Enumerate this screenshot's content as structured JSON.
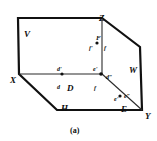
{
  "figure": {
    "caption": "(a)",
    "stroke_color": "#111111",
    "thin_color": "#2b2b2b",
    "background": "#ffffff",
    "vertices": [
      {
        "name": "V",
        "label": "V",
        "x": 24,
        "y": 30
      },
      {
        "name": "Z",
        "label": "Z",
        "x": 99,
        "y": 14
      },
      {
        "name": "W",
        "label": "W",
        "x": 129,
        "y": 66
      },
      {
        "name": "Y",
        "label": "Y",
        "x": 145,
        "y": 112
      },
      {
        "name": "H",
        "label": "H",
        "x": 61,
        "y": 104
      },
      {
        "name": "X",
        "label": "X",
        "x": 10,
        "y": 76
      },
      {
        "name": "D",
        "label": "D",
        "x": 67,
        "y": 84
      },
      {
        "name": "E",
        "label": "E",
        "x": 121,
        "y": 105
      },
      {
        "name": "F",
        "label": "F",
        "x": 96,
        "y": 35
      }
    ],
    "point_labels": [
      {
        "name": "f-prime-top",
        "label": "f'",
        "x": 89,
        "y": 45
      },
      {
        "name": "f-top",
        "label": "f",
        "x": 104,
        "y": 45
      },
      {
        "name": "d-prime",
        "label": "d'",
        "x": 57,
        "y": 66
      },
      {
        "name": "d",
        "label": "d",
        "x": 57,
        "y": 84
      },
      {
        "name": "e-prime-mid",
        "label": "e'",
        "x": 93,
        "y": 66
      },
      {
        "name": "d-double-prime",
        "label": "d″",
        "x": 106,
        "y": 74
      },
      {
        "name": "f-mid",
        "label": "f",
        "x": 94,
        "y": 85
      },
      {
        "name": "e-prime-low",
        "label": "e'",
        "x": 114,
        "y": 96
      },
      {
        "name": "e-double-prime",
        "label": "e″",
        "x": 124,
        "y": 93
      }
    ],
    "dots": [
      {
        "name": "dot-f",
        "x": 97,
        "y": 43
      },
      {
        "name": "dot-d",
        "x": 62,
        "y": 74
      },
      {
        "name": "dot-e-mid",
        "x": 101,
        "y": 74
      },
      {
        "name": "dot-e-low",
        "x": 120,
        "y": 96
      }
    ]
  }
}
